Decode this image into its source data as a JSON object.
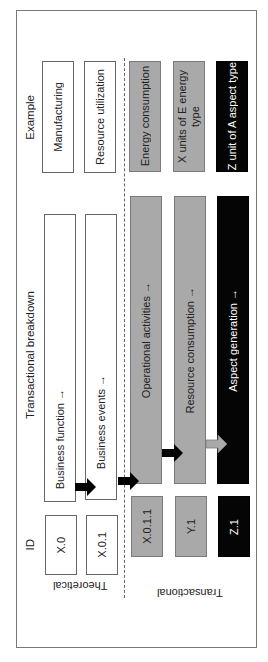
{
  "headers": {
    "example": "Example",
    "breakdown": "Transactional breakdown",
    "id": "ID"
  },
  "sections": {
    "theoretical": "Theoretical",
    "transactional": "Transactional"
  },
  "rows": [
    {
      "id": "X.0",
      "breakdown": "Business function →",
      "example": "Manufacturing",
      "style": "white"
    },
    {
      "id": "X.0.1",
      "breakdown": "Business events →",
      "example": "Resource utilization",
      "style": "white"
    },
    {
      "id": "X.0.1.1",
      "breakdown": "Operational activities →",
      "example": "Energy consumption",
      "style": "gray"
    },
    {
      "id": "Y.1",
      "breakdown": "Resource consumption →",
      "example": "X units of E energy type",
      "style": "gray"
    },
    {
      "id": "Z.1",
      "breakdown": "Aspect generation →",
      "example": "Z unit of A aspect type",
      "style": "black"
    }
  ],
  "colors": {
    "white_box": "#ffffff",
    "gray_box": "#a9a9a9",
    "black_box": "#050505",
    "arrow_black": "#000000",
    "arrow_gray": "#a9a9a9"
  }
}
